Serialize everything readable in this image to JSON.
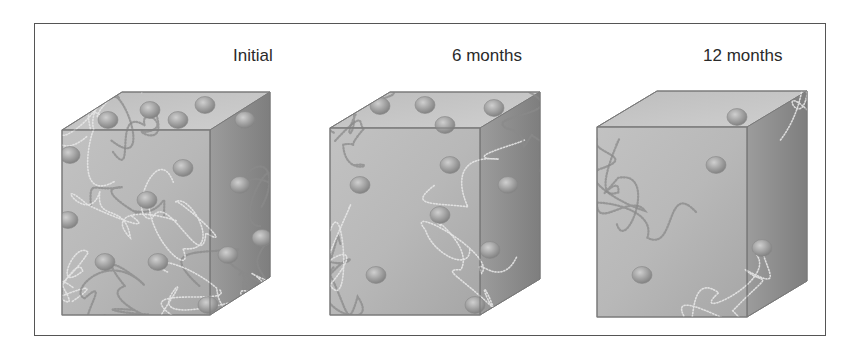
{
  "figure": {
    "panels": [
      {
        "label": "Initial",
        "label_x": 233,
        "cube": {
          "fx": 62,
          "fy": 130,
          "fw": 148,
          "fh": 185,
          "dx": 60,
          "dy": -38
        },
        "chain_density": "high",
        "chain_count": 14,
        "particles": [
          [
            70,
            155
          ],
          [
            108,
            120
          ],
          [
            150,
            110
          ],
          [
            178,
            120
          ],
          [
            205,
            105
          ],
          [
            183,
            168
          ],
          [
            147,
            200
          ],
          [
            68,
            220
          ],
          [
            105,
            262
          ],
          [
            158,
            262
          ],
          [
            208,
            305
          ],
          [
            240,
            185
          ],
          [
            262,
            238
          ],
          [
            228,
            255
          ],
          [
            245,
            120
          ]
        ]
      },
      {
        "label": "6 months",
        "label_x": 452,
        "cube": {
          "fx": 330,
          "fy": 128,
          "fw": 150,
          "fh": 187,
          "dx": 60,
          "dy": -36
        },
        "chain_density": "medium",
        "chain_count": 8,
        "particles": [
          [
            380,
            106
          ],
          [
            425,
            105
          ],
          [
            494,
            108
          ],
          [
            445,
            125
          ],
          [
            360,
            185
          ],
          [
            450,
            165
          ],
          [
            440,
            215
          ],
          [
            376,
            275
          ],
          [
            475,
            305
          ],
          [
            508,
            185
          ],
          [
            490,
            250
          ]
        ]
      },
      {
        "label": "12 months",
        "label_x": 703,
        "cube": {
          "fx": 597,
          "fy": 127,
          "fw": 150,
          "fh": 190,
          "dx": 60,
          "dy": -36
        },
        "chain_density": "low",
        "chain_count": 4,
        "particles": [
          [
            737,
            117
          ],
          [
            716,
            165
          ],
          [
            642,
            275
          ],
          [
            762,
            248
          ]
        ]
      }
    ],
    "colors": {
      "frame": "#555555",
      "front_face": "#b4b4b4",
      "top_face": "#c9c9c9",
      "side_face": "#8f8f8f",
      "edge": "#7a7a7a",
      "chain": "#e6e6e6",
      "chain_dark": "#8a8a8a",
      "particle": "#9a9a9a",
      "label": "#2a2a2a"
    }
  }
}
